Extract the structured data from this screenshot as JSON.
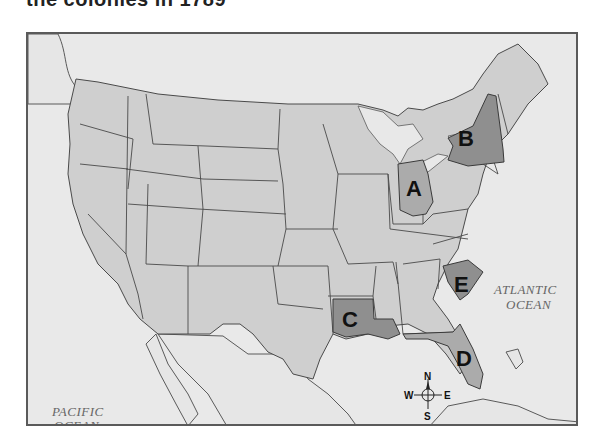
{
  "header": {
    "title": "the colonies in 1789"
  },
  "map": {
    "labels": [
      {
        "id": "A",
        "text": "A",
        "state": "Ohio"
      },
      {
        "id": "B",
        "text": "B",
        "state": "New York"
      },
      {
        "id": "C",
        "text": "C",
        "state": "Louisiana"
      },
      {
        "id": "D",
        "text": "D",
        "state": "Florida"
      },
      {
        "id": "E",
        "text": "E",
        "state": "South Carolina"
      }
    ],
    "oceans": {
      "atlantic_line1": "ATLANTIC",
      "atlantic_line2": "OCEAN",
      "pacific_line1": "PACIFIC",
      "pacific_line2": "OCEAN"
    },
    "compass": {
      "north": "N",
      "south": "S",
      "east": "E",
      "west": "W"
    },
    "colors": {
      "water": "#e9e9e9",
      "land": "#cfcfcf",
      "highlight_dark": "#8f8f8f",
      "highlight_mid": "#ababab",
      "border": "#4a4a4a"
    }
  }
}
